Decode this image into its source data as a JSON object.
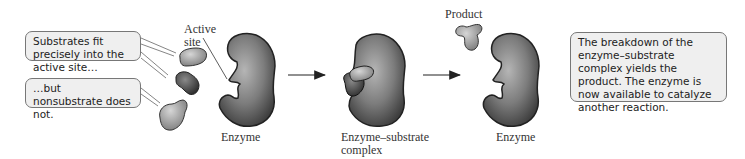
{
  "callouts": {
    "substrates_fit": "Substrates fit precisely into the active site…",
    "nonsubstrate": "…but nonsubstrate does not.",
    "breakdown": "The breakdown of the enzyme–substrate complex yields the product. The enzyme is now available to catalyze another reaction."
  },
  "labels": {
    "active_site_line1": "Active",
    "active_site_line2": "site",
    "enzyme_1": "Enzyme",
    "complex_line1": "Enzyme–substrate",
    "complex_line2": "complex",
    "product": "Product",
    "enzyme_2": "Enzyme"
  },
  "colors": {
    "callout_bg": "#efefef",
    "callout_border": "#777777",
    "enzyme_fill": "#7a7a7a",
    "substrate_fill": "#a8a8a8",
    "nonsubstrate_fill": "#555555"
  }
}
